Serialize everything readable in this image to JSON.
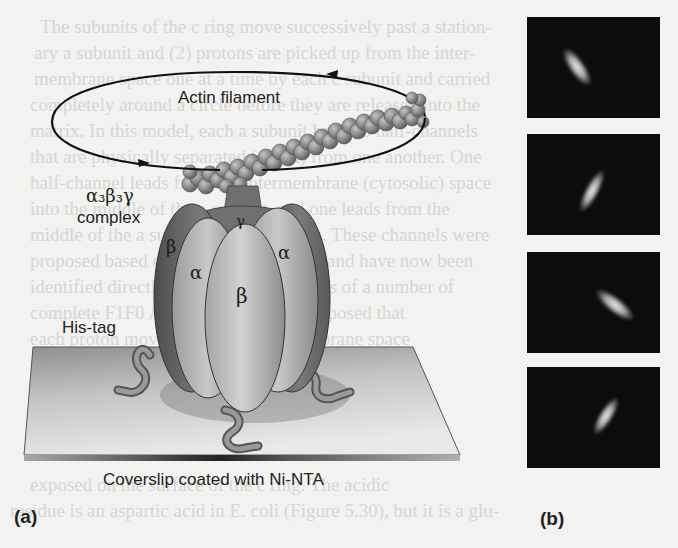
{
  "background_text": {
    "lines": [
      "The subunits of the c ring move successively past a station-",
      "ary a subunit and (2) protons are picked up from the inter-",
      "membrane space one at a time by each c subunit and carried",
      "completely around a circle before they are released into the",
      "matrix. In this model, each a subunit has two half-channels",
      "that are physically separated (offset) from one another. One",
      "half-channel leads from the intermembrane (cytosolic) space",
      "into the middle of the a subunit, and one leads from the",
      "middle of the a subunit into the matrix. These channels were",
      "proposed based on theoretical grounds and have now been",
      "identified directly in cryo-EM structures of a number of",
      "complete F1F0 ATP synthases. It is proposed that",
      "each proton moves from the intermembrane space",
      "half-channel and binds to the residue",
      "exposed on the surface of the c ring. The acidic",
      "residue is an aspartic acid in E. coli (Figure 5.30), but it is a glu-"
    ]
  },
  "figure_a": {
    "panel_label": "(a)",
    "orbit_label": "Actin filament",
    "complex_label_formula": "α₃β₃γ",
    "complex_label_word": "complex",
    "subunit_labels": {
      "gamma": "γ",
      "beta_left": "β",
      "alpha_left": "α",
      "beta_center": "β",
      "alpha_right": "α"
    },
    "tag_label": "His-tag",
    "surface_label": "Coverslip coated with Ni-NTA"
  },
  "figure_b": {
    "panel_label": "(b)",
    "frames": [
      {
        "index": 1,
        "orientation_deg": -55
      },
      {
        "index": 2,
        "orientation_deg": 60
      },
      {
        "index": 3,
        "orientation_deg": -35
      },
      {
        "index": 4,
        "orientation_deg": 60
      }
    ]
  },
  "colors": {
    "page_background": "#f2f2f0",
    "ink": "#222222",
    "micrograph_background": "#0c0c0c",
    "protein_dark": "#6e6e6e",
    "protein_light": "#bdbdbd",
    "coverslip": "#c9c9c9"
  }
}
